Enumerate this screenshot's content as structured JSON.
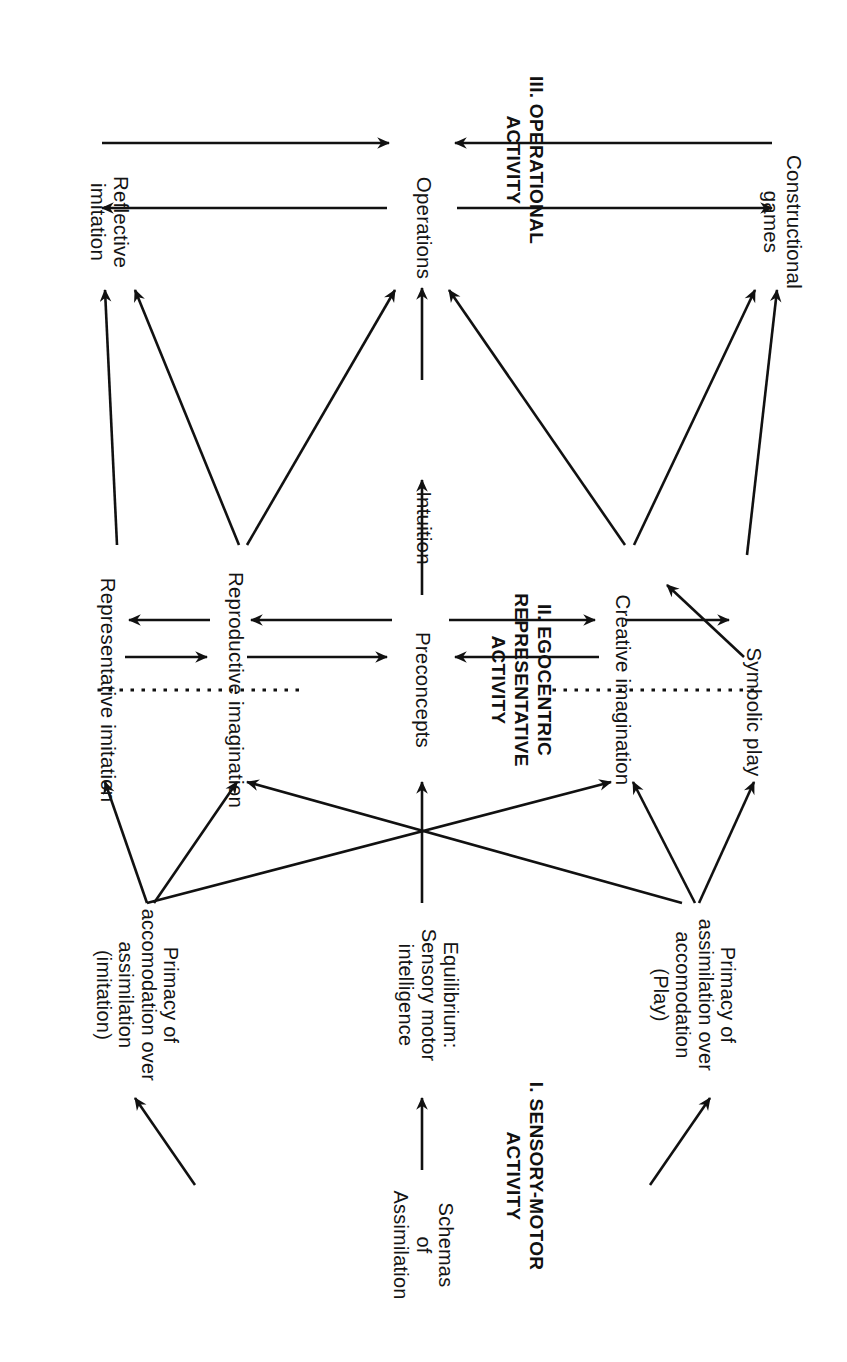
{
  "figure": {
    "type": "diagram",
    "background_color": "#ffffff",
    "ink_color": "#111111"
  },
  "stage_headings": [
    {
      "numeral": "I.",
      "title": "I. SENSORY-MOTOR\nACTIVITY"
    },
    {
      "numeral": "II.",
      "title": "II. EGOCENTRIC\nREPRESENTATIVE\nACTIVITY"
    },
    {
      "numeral": "III.",
      "title": "III. OPERATIONAL\nACTIVITY"
    }
  ],
  "nodes": {
    "schemas": "Schemas\nof\nAssimilation",
    "primacy_assimilation": "Primacy of\nassimilation over\naccomodation\n(Play)",
    "equilibrium": "Equilibrium:\nSensory motor\nintelligence",
    "primacy_accomodation": "Primacy of\naccomodation over\nassimilation\n(imitation)",
    "symbolic_play": "Symbolic  play",
    "creative_imagination": "Creative imagination",
    "preconcepts": "Preconcepts",
    "intuition": "Intuition",
    "reproductive_imagination": "Reproductive  imagination",
    "representative_imitation": "Representative  imitation",
    "constructional_games": "Constructional\ngames",
    "operations": "Operations",
    "reflective_imitation": "Reflective\nimitation"
  },
  "connections": [
    {
      "from": "schemas",
      "to": "primacy_assimilation",
      "kind": "arrow"
    },
    {
      "from": "schemas",
      "to": "equilibrium",
      "kind": "arrow"
    },
    {
      "from": "schemas",
      "to": "primacy_accomodation",
      "kind": "arrow"
    },
    {
      "from": "primacy_assimilation",
      "to": "symbolic_play",
      "kind": "arrow"
    },
    {
      "from": "primacy_assimilation",
      "to": "creative_imagination",
      "kind": "arrow"
    },
    {
      "from": "primacy_assimilation",
      "to": "reproductive_imagination",
      "kind": "arrow"
    },
    {
      "from": "equilibrium",
      "to": "preconcepts",
      "kind": "arrow"
    },
    {
      "from": "primacy_accomodation",
      "to": "creative_imagination",
      "kind": "arrow"
    },
    {
      "from": "primacy_accomodation",
      "to": "reproductive_imagination",
      "kind": "arrow"
    },
    {
      "from": "primacy_accomodation",
      "to": "representative_imitation",
      "kind": "arrow"
    },
    {
      "from": "symbolic_play",
      "to": "creative_imagination",
      "kind": "arrow"
    },
    {
      "from": "creative_imagination",
      "to": "symbolic_play",
      "kind": "arrow"
    },
    {
      "from": "creative_imagination",
      "to": "preconcepts",
      "kind": "arrow"
    },
    {
      "from": "preconcepts",
      "to": "creative_imagination",
      "kind": "arrow"
    },
    {
      "from": "preconcepts",
      "to": "intuition",
      "kind": "arrow"
    },
    {
      "from": "preconcepts",
      "to": "reproductive_imagination",
      "kind": "arrow"
    },
    {
      "from": "reproductive_imagination",
      "to": "preconcepts",
      "kind": "arrow"
    },
    {
      "from": "reproductive_imagination",
      "to": "representative_imitation",
      "kind": "arrow"
    },
    {
      "from": "representative_imitation",
      "to": "reproductive_imagination",
      "kind": "arrow"
    },
    {
      "from": "symbolic_play",
      "to": "constructional_games",
      "kind": "arrow"
    },
    {
      "from": "creative_imagination",
      "to": "constructional_games",
      "kind": "arrow"
    },
    {
      "from": "creative_imagination",
      "to": "operations",
      "kind": "arrow"
    },
    {
      "from": "intuition",
      "to": "operations",
      "kind": "arrow"
    },
    {
      "from": "reproductive_imagination",
      "to": "operations",
      "kind": "arrow"
    },
    {
      "from": "reproductive_imagination",
      "to": "reflective_imitation",
      "kind": "arrow"
    },
    {
      "from": "representative_imitation",
      "to": "reflective_imitation",
      "kind": "arrow"
    },
    {
      "from": "constructional_games",
      "to": "operations",
      "kind": "arrow"
    },
    {
      "from": "operations",
      "to": "constructional_games",
      "kind": "arrow"
    },
    {
      "from": "operations",
      "to": "reflective_imitation",
      "kind": "arrow"
    },
    {
      "from": "reflective_imitation",
      "to": "operations",
      "kind": "arrow"
    }
  ],
  "dividers": [
    {
      "name": "divider-stage-2-3-upper",
      "style": "dotted"
    },
    {
      "name": "divider-stage-2-3-lower",
      "style": "dotted"
    }
  ]
}
